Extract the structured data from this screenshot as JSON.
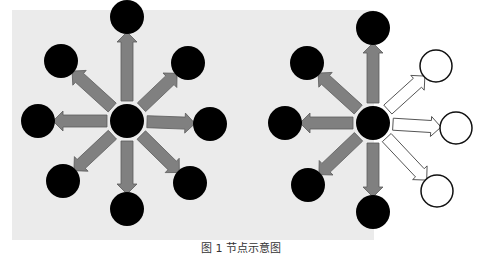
{
  "colors": {
    "background": "#ffffff",
    "panel": "#ebebeb",
    "node_filled": "#000000",
    "node_hollow_stroke": "#111111",
    "arrow_fill": "#808080",
    "arrow_stroke": "#5a5a5a",
    "arrow_hollow_fill": "#ffffff",
    "arrow_hollow_stroke": "#555555"
  },
  "panel": {
    "x": 12,
    "y": 10,
    "width": 362,
    "height": 230
  },
  "node_radius": 17,
  "diagrams": [
    {
      "name": "left-diagram",
      "description": "Central node broadcasting to eight filled neighbor nodes",
      "center": {
        "x": 127,
        "y": 121
      },
      "neighbors": [
        {
          "id": "top",
          "x": 127,
          "y": 17,
          "filled": true
        },
        {
          "id": "top-right",
          "x": 188,
          "y": 63,
          "filled": true
        },
        {
          "id": "right",
          "x": 210,
          "y": 124,
          "filled": true
        },
        {
          "id": "bottom-right",
          "x": 190,
          "y": 183,
          "filled": true
        },
        {
          "id": "bottom",
          "x": 127,
          "y": 209,
          "filled": true
        },
        {
          "id": "bottom-left",
          "x": 63,
          "y": 181,
          "filled": true
        },
        {
          "id": "left",
          "x": 38,
          "y": 121,
          "filled": true
        },
        {
          "id": "top-left",
          "x": 61,
          "y": 61,
          "filled": true
        }
      ]
    },
    {
      "name": "right-diagram",
      "description": "Central node with five filled neighbors (gray arrows) and three hollow neighbors (outlined arrows)",
      "center": {
        "x": 373,
        "y": 123
      },
      "neighbors": [
        {
          "id": "top",
          "x": 373,
          "y": 28,
          "filled": true
        },
        {
          "id": "top-right",
          "x": 436,
          "y": 66,
          "filled": false
        },
        {
          "id": "right",
          "x": 456,
          "y": 128,
          "filled": false
        },
        {
          "id": "bottom-right",
          "x": 437,
          "y": 191,
          "filled": false
        },
        {
          "id": "bottom",
          "x": 373,
          "y": 212,
          "filled": true
        },
        {
          "id": "bottom-left",
          "x": 308,
          "y": 185,
          "filled": true
        },
        {
          "id": "left",
          "x": 285,
          "y": 123,
          "filled": true
        },
        {
          "id": "top-left",
          "x": 307,
          "y": 63,
          "filled": true
        }
      ]
    }
  ],
  "caption": "图 1   节点示意图"
}
